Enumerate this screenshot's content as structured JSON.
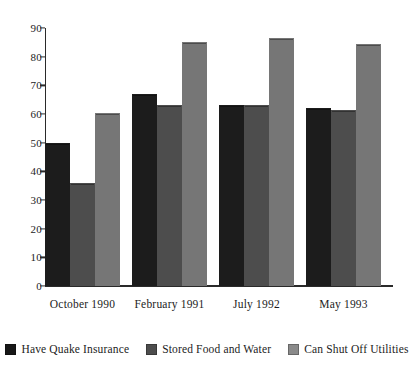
{
  "chart_data": {
    "type": "bar",
    "title": "",
    "subtitle": "",
    "xlabel": "",
    "ylabel": "",
    "categories": [
      "October 1990",
      "February 1991",
      "July 1992",
      "May 1993"
    ],
    "series": [
      {
        "name": "Have Quake Insurance",
        "color": "#1c1c1c",
        "values": [
          50,
          67,
          63,
          62
        ]
      },
      {
        "name": "Stored Food and Water",
        "color": "#4d4d4d",
        "values": [
          36,
          63,
          63,
          61.5
        ]
      },
      {
        "name": "Can Shut Off Utilities",
        "color": "#767676",
        "values": [
          60.5,
          85,
          86.5,
          84.5
        ]
      }
    ],
    "ylim": [
      0,
      90
    ],
    "ytick_step": 10,
    "yticks": [
      "0",
      "10",
      "20",
      "30",
      "40",
      "50",
      "60",
      "70",
      "80",
      "90"
    ],
    "grid": false,
    "legend_position": "bottom"
  },
  "legend": {
    "items": [
      {
        "label": "Have Quake Insurance"
      },
      {
        "label": "Stored Food and Water"
      },
      {
        "label": "Can Shut Off Utilities"
      }
    ]
  }
}
